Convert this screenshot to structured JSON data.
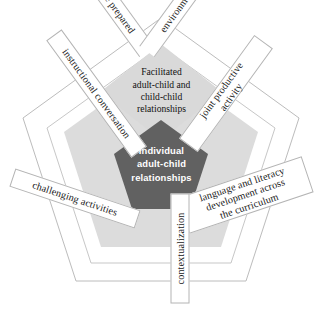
{
  "diagram": {
    "type": "nested-pentagon",
    "colors": {
      "page_background": "#ffffff",
      "outer_pentagon_stroke": "#b9b9b9",
      "band_fill": "#ffffff",
      "band_stroke": "#b4b4b4",
      "middle_pentagon_fill": "#dcdcdc",
      "inner_diamond_fill": "#d9d9d9",
      "center_pentagon_fill": "#616161",
      "center_text": "#ffffff",
      "band_text": "#1a1a1a"
    },
    "center": {
      "name": "individual-adult-child-relationships",
      "lines": [
        "Individual",
        "adult-child",
        "relationships"
      ]
    },
    "inner_diamond": {
      "name": "facilitated-relationships",
      "lines": [
        "Facilitated",
        "adult-child and",
        "child-child",
        "relationships"
      ]
    },
    "bands": {
      "top_left_half": "The prepared",
      "top_right_half": "environment",
      "top_full": "The prepared environment",
      "upper_left": "instructional conversation",
      "upper_right_line1": "joint productive",
      "upper_right_line2": "activity",
      "upper_right_full": "joint productive activity",
      "right_line1": "language and literacy",
      "right_line2": "development across",
      "right_line3": "the curriculum",
      "right_full": "language and literacy development across the curriculum",
      "left": "challenging activities",
      "bottom": "contextualization"
    }
  }
}
